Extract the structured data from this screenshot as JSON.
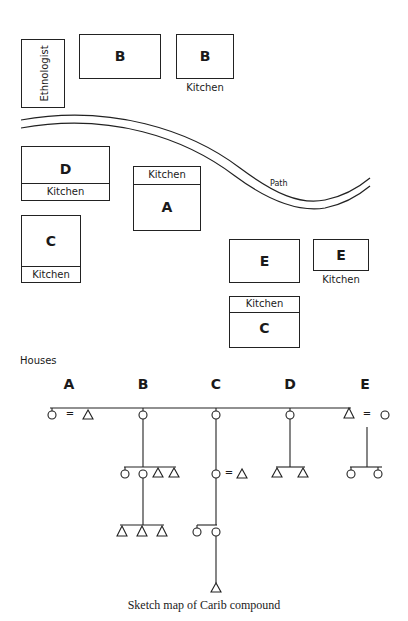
{
  "map": {
    "ethnologist": {
      "label": "Ethnologist"
    },
    "houses": [
      {
        "id": "B",
        "label": "B",
        "kitchen": false
      },
      {
        "id": "B-kitchen",
        "label": "B",
        "kitchen_label": "Kitchen"
      },
      {
        "id": "D",
        "label": "D",
        "kitchen_label": "Kitchen"
      },
      {
        "id": "A",
        "label": "A",
        "kitchen_label": "Kitchen"
      },
      {
        "id": "C",
        "label": "C",
        "kitchen_label": "Kitchen"
      },
      {
        "id": "E",
        "label": "E"
      },
      {
        "id": "E-kitchen",
        "label": "E",
        "kitchen_label": "Kitchen"
      },
      {
        "id": "C2",
        "label": "C",
        "kitchen_label": "Kitchen"
      }
    ],
    "path_label": "Path"
  },
  "kinship": {
    "title": "Houses",
    "columns": [
      "A",
      "B",
      "C",
      "D",
      "E"
    ],
    "equals_sign": "="
  },
  "caption": "Sketch map of Carib compound"
}
